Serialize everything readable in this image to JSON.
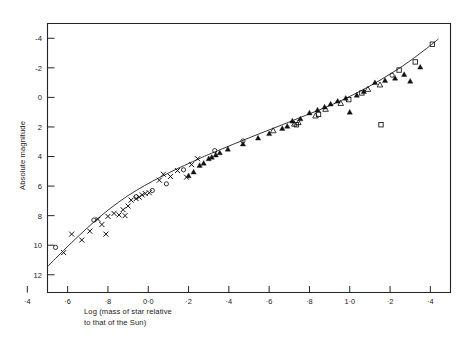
{
  "chart_data": {
    "type": "scatter",
    "title": "",
    "xlabel": "Log (mass of star relative\nto that of the Sun)",
    "ylabel": "Absolute magnitude",
    "xlim": [
      -0.5,
      1.5
    ],
    "ylim": [
      13.2,
      -5.0
    ],
    "y_inverted": true,
    "grid": false,
    "legend": "none",
    "xticks": [
      -0.4,
      -0.2,
      0.0,
      0.2,
      0.4,
      0.6,
      0.8,
      1.0,
      1.2,
      1.4
    ],
    "xticklabels": [
      "·4",
      "·6",
      "·8",
      "0·0",
      "·2",
      "·4",
      "·6",
      "·8",
      "1·0",
      "·2",
      "·4"
    ],
    "xtick_values_plotted": [
      -0.6,
      -0.4,
      -0.2,
      0.0,
      0.2,
      0.4,
      0.6,
      0.8,
      1.0,
      1.2,
      1.4
    ],
    "yticks": [
      -4,
      -2,
      0,
      2,
      4,
      6,
      8,
      10,
      12
    ],
    "yticklabels": [
      "-4",
      "-2",
      "0",
      "2",
      "4",
      "6",
      "8",
      "10",
      "12"
    ],
    "fit_curve": {
      "name": "mass-luminosity relation",
      "points": [
        [
          -0.62,
          13.1
        ],
        [
          -0.58,
          12.55
        ],
        [
          -0.54,
          12.0
        ],
        [
          -0.5,
          11.45
        ],
        [
          -0.46,
          10.9
        ],
        [
          -0.42,
          10.35
        ],
        [
          -0.38,
          9.82
        ],
        [
          -0.34,
          9.3
        ],
        [
          -0.3,
          8.8
        ],
        [
          -0.26,
          8.3
        ],
        [
          -0.22,
          7.85
        ],
        [
          -0.18,
          7.42
        ],
        [
          -0.14,
          7.02
        ],
        [
          -0.1,
          6.64
        ],
        [
          -0.06,
          6.3
        ],
        [
          -0.02,
          5.98
        ],
        [
          0.02,
          5.68
        ],
        [
          0.06,
          5.4
        ],
        [
          0.1,
          5.12
        ],
        [
          0.14,
          4.85
        ],
        [
          0.18,
          4.6
        ],
        [
          0.22,
          4.35
        ],
        [
          0.26,
          4.1
        ],
        [
          0.3,
          3.86
        ],
        [
          0.36,
          3.52
        ],
        [
          0.42,
          3.18
        ],
        [
          0.48,
          2.85
        ],
        [
          0.54,
          2.52
        ],
        [
          0.6,
          2.2
        ],
        [
          0.66,
          1.88
        ],
        [
          0.72,
          1.55
        ],
        [
          0.78,
          1.22
        ],
        [
          0.84,
          0.9
        ],
        [
          0.9,
          0.56
        ],
        [
          0.96,
          0.2
        ],
        [
          1.02,
          -0.2
        ],
        [
          1.08,
          -0.62
        ],
        [
          1.14,
          -1.08
        ],
        [
          1.2,
          -1.58
        ],
        [
          1.26,
          -2.1
        ],
        [
          1.32,
          -2.68
        ],
        [
          1.38,
          -3.3
        ],
        [
          1.44,
          -3.95
        ]
      ]
    },
    "series": [
      {
        "name": "cross",
        "marker": "x",
        "fill": "none",
        "color": "#111111",
        "points": [
          [
            -0.53,
            11.0
          ],
          [
            -0.42,
            10.5
          ],
          [
            -0.38,
            9.25
          ],
          [
            -0.33,
            9.65
          ],
          [
            -0.29,
            9.05
          ],
          [
            -0.25,
            8.25
          ],
          [
            -0.23,
            8.6
          ],
          [
            -0.21,
            9.25
          ],
          [
            -0.2,
            8.05
          ],
          [
            -0.17,
            7.85
          ],
          [
            -0.145,
            7.95
          ],
          [
            -0.125,
            7.6
          ],
          [
            -0.115,
            8.0
          ],
          [
            -0.1,
            7.35
          ],
          [
            -0.085,
            6.95
          ],
          [
            -0.06,
            6.85
          ],
          [
            -0.045,
            6.75
          ],
          [
            -0.03,
            6.6
          ],
          [
            -0.015,
            6.5
          ],
          [
            0.005,
            6.45
          ],
          [
            0.055,
            5.6
          ],
          [
            0.075,
            5.2
          ],
          [
            0.11,
            5.35
          ],
          [
            0.145,
            4.95
          ],
          [
            0.19,
            5.4
          ],
          [
            0.215,
            4.55
          ],
          [
            0.245,
            4.15
          ]
        ]
      },
      {
        "name": "open-circle",
        "marker": "o",
        "fill": "none",
        "color": "#111111",
        "points": [
          [
            -0.58,
            11.6
          ],
          [
            -0.46,
            10.15
          ],
          [
            -0.27,
            8.3
          ],
          [
            -0.06,
            6.72
          ],
          [
            0.02,
            6.3
          ],
          [
            0.09,
            5.85
          ],
          [
            0.175,
            4.9
          ],
          [
            0.33,
            3.6
          ],
          [
            0.47,
            2.95
          ],
          [
            1.21,
            -1.5
          ]
        ]
      },
      {
        "name": "filled-triangle",
        "marker": "triangle-filled",
        "fill": "solid",
        "color": "#111111",
        "points": [
          [
            0.2,
            5.3
          ],
          [
            0.225,
            5.05
          ],
          [
            0.255,
            4.6
          ],
          [
            0.275,
            4.45
          ],
          [
            0.3,
            4.15
          ],
          [
            0.315,
            4.05
          ],
          [
            0.335,
            3.9
          ],
          [
            0.355,
            3.75
          ],
          [
            0.395,
            3.5
          ],
          [
            0.47,
            3.15
          ],
          [
            0.545,
            2.75
          ],
          [
            0.6,
            2.45
          ],
          [
            0.665,
            2.1
          ],
          [
            0.69,
            1.95
          ],
          [
            0.715,
            1.6
          ],
          [
            0.755,
            1.45
          ],
          [
            0.8,
            1.05
          ],
          [
            0.84,
            0.85
          ],
          [
            0.875,
            0.65
          ],
          [
            0.905,
            0.45
          ],
          [
            0.94,
            0.25
          ],
          [
            0.98,
            0.05
          ],
          [
            1.0,
            1.0
          ],
          [
            1.035,
            -0.15
          ],
          [
            1.07,
            -0.4
          ],
          [
            1.125,
            -1.0
          ],
          [
            1.175,
            -1.15
          ],
          [
            1.225,
            -1.3
          ],
          [
            1.27,
            -1.55
          ],
          [
            1.3,
            -1.1
          ],
          [
            1.35,
            -2.05
          ]
        ]
      },
      {
        "name": "open-triangle",
        "marker": "triangle-open",
        "fill": "none",
        "color": "#111111",
        "points": [
          [
            0.62,
            2.25
          ],
          [
            0.725,
            1.8
          ],
          [
            0.745,
            1.7
          ],
          [
            0.83,
            1.25
          ],
          [
            0.88,
            0.8
          ],
          [
            0.955,
            0.4
          ],
          [
            1.09,
            -0.55
          ],
          [
            1.15,
            -0.85
          ]
        ]
      },
      {
        "name": "open-square",
        "marker": "square-open",
        "fill": "none",
        "color": "#111111",
        "points": [
          [
            0.735,
            1.85
          ],
          [
            0.845,
            1.15
          ],
          [
            0.995,
            0.15
          ],
          [
            1.06,
            -0.3
          ],
          [
            1.155,
            1.85
          ],
          [
            1.245,
            -1.85
          ],
          [
            1.325,
            -2.4
          ],
          [
            1.41,
            -3.6
          ]
        ]
      }
    ]
  },
  "axes": {
    "x_title": "Log (mass of star relative\nto that of the Sun)",
    "y_title": "Absolute magnitude"
  }
}
